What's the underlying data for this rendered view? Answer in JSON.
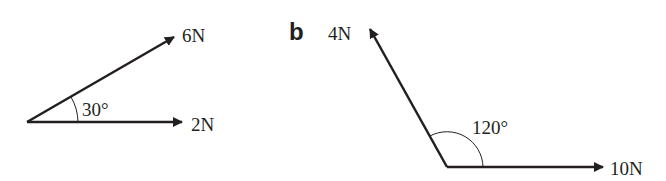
{
  "diagram_a": {
    "vectors": [
      {
        "label": "6N",
        "magnitude": 6,
        "angle_deg": 30
      },
      {
        "label": "2N",
        "magnitude": 2,
        "angle_deg": 0
      }
    ],
    "angle_label": "30°"
  },
  "diagram_b": {
    "part_label": "b",
    "vectors": [
      {
        "label": "4N",
        "magnitude": 4,
        "angle_deg": 120
      },
      {
        "label": "10N",
        "magnitude": 10,
        "angle_deg": 0
      }
    ],
    "angle_label": "120°"
  },
  "colors": {
    "ink": "#231f20",
    "background": "#ffffff"
  }
}
